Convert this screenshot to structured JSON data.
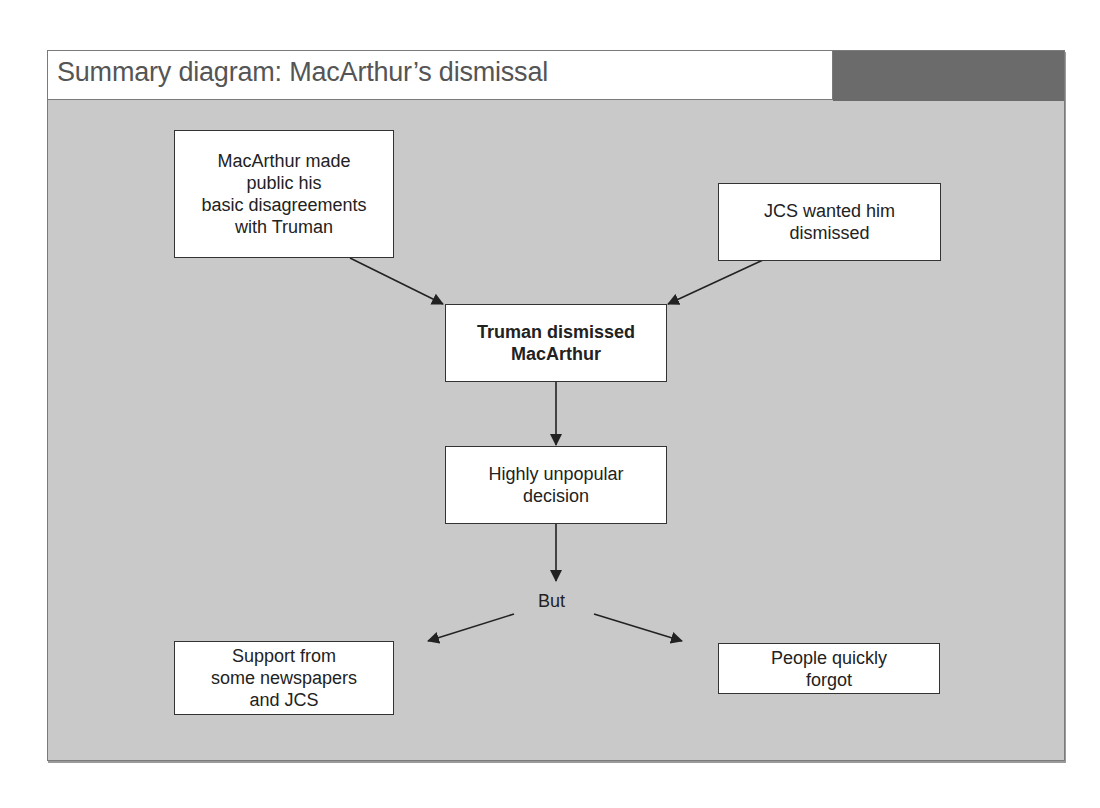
{
  "title": "Summary diagram: MacArthur’s dismissal",
  "colors": {
    "background": "#c9c9c9",
    "title_band": "#ffffff",
    "dark_block": "#6b6b6b",
    "box_fill": "#ffffff",
    "box_border": "#333333",
    "arrow": "#222222"
  },
  "nodes": {
    "macarthur_public": {
      "lines": [
        "MacArthur made",
        "public his",
        "basic disagreements",
        "with Truman"
      ]
    },
    "jcs_wanted": {
      "lines": [
        "JCS wanted him",
        "dismissed"
      ]
    },
    "truman_dismissed": {
      "lines": [
        "Truman dismissed",
        "MacArthur"
      ],
      "bold": true
    },
    "unpopular": {
      "lines": [
        "Highly unpopular",
        "decision"
      ]
    },
    "but_label": "But",
    "support": {
      "lines": [
        "Support from",
        "some newspapers",
        "and JCS"
      ]
    },
    "forgot": {
      "lines": [
        "People quickly",
        "forgot"
      ]
    }
  },
  "edges": [
    {
      "from": "macarthur_public",
      "to": "truman_dismissed"
    },
    {
      "from": "jcs_wanted",
      "to": "truman_dismissed"
    },
    {
      "from": "truman_dismissed",
      "to": "unpopular"
    },
    {
      "from": "unpopular",
      "to": "but_label"
    },
    {
      "from": "but_label",
      "to": "support"
    },
    {
      "from": "but_label",
      "to": "forgot"
    }
  ]
}
